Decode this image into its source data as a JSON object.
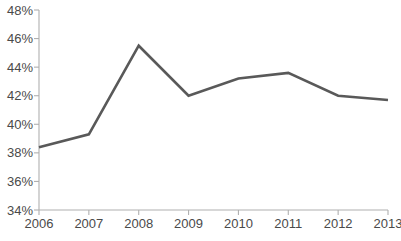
{
  "chart_data": {
    "type": "line",
    "title": "",
    "subtitle": "",
    "xlabel": "",
    "ylabel": "",
    "categories": [
      "2006",
      "2007",
      "2008",
      "2009",
      "2010",
      "2011",
      "2012",
      "2013"
    ],
    "x": [
      2006,
      2007,
      2008,
      2009,
      2010,
      2011,
      2012,
      2013
    ],
    "values": [
      38.4,
      39.3,
      45.5,
      42.0,
      43.2,
      43.6,
      42.0,
      41.7
    ],
    "series": [
      {
        "name": "",
        "values": [
          38.4,
          39.3,
          45.5,
          42.0,
          43.2,
          43.6,
          42.0,
          41.7
        ],
        "color": "#595959"
      }
    ],
    "ylim": [
      34,
      48
    ],
    "xlim": [
      2006,
      2013
    ],
    "y_ticks": [
      34,
      36,
      38,
      40,
      42,
      44,
      46,
      48
    ],
    "y_tick_labels": [
      "34%",
      "36%",
      "38%",
      "40%",
      "42%",
      "44%",
      "46%",
      "48%"
    ],
    "x_ticks": [
      2006,
      2007,
      2008,
      2009,
      2010,
      2011,
      2012,
      2013
    ],
    "x_tick_labels": [
      "2006",
      "2007",
      "2008",
      "2009",
      "2010",
      "2011",
      "2012",
      "2013"
    ],
    "grid": false,
    "legend": false,
    "legend_position": "none",
    "markers": false,
    "annotations": []
  },
  "style": {
    "line_color": "#595959",
    "axis_color": "#b0b0b0",
    "label_color": "#4a4a4a",
    "background": "#ffffff"
  },
  "geometry": {
    "plot_left": 39,
    "plot_right": 388,
    "plot_top": 10,
    "plot_bottom": 210,
    "y_label_x": 33,
    "x_label_y": 228,
    "tick_len": 5
  }
}
